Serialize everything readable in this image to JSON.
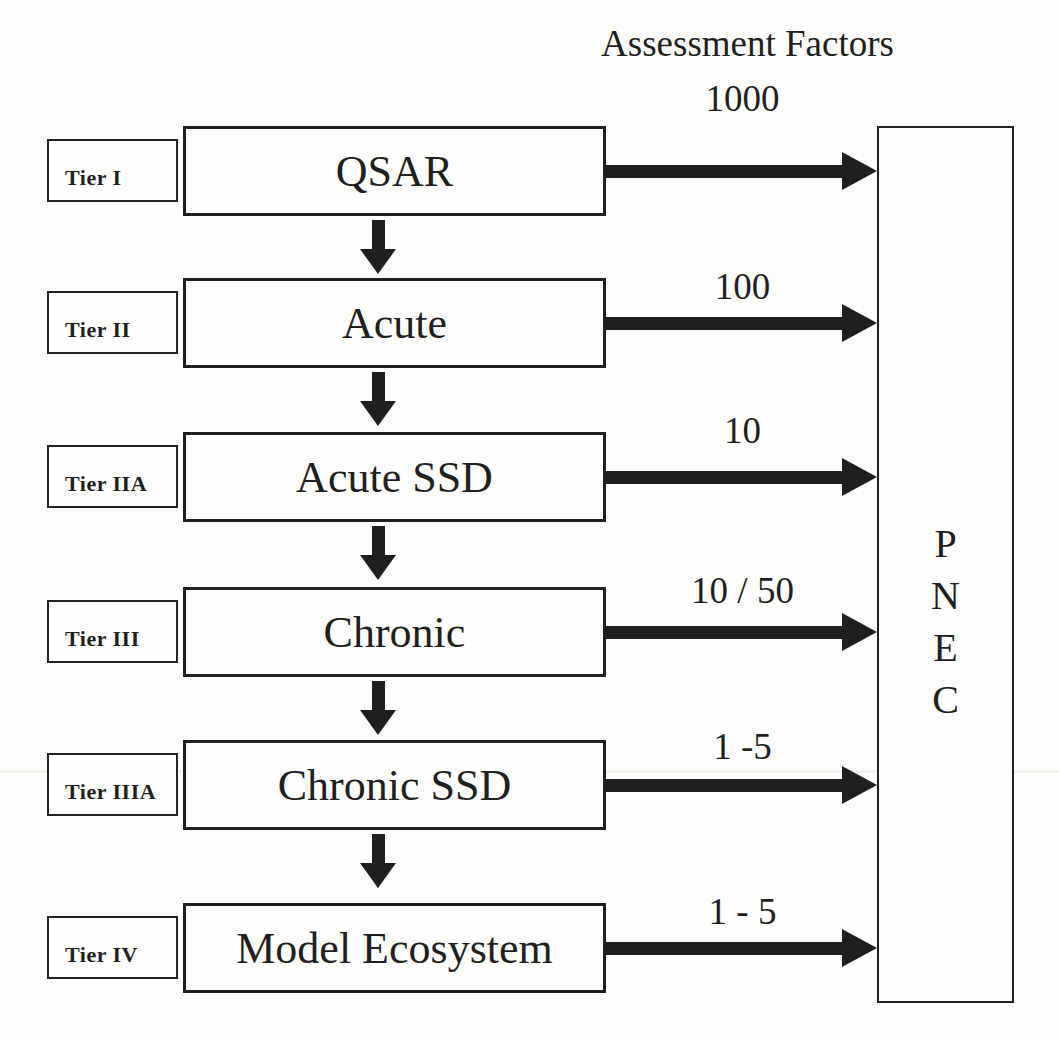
{
  "page": {
    "ink_color": "#1f1f1f",
    "background_color": "#fdfdfc"
  },
  "heading": {
    "title": "Assessment Factors"
  },
  "rows": [
    {
      "tier": "Tier I",
      "method": "QSAR",
      "factor": "1000"
    },
    {
      "tier": "Tier II",
      "method": "Acute",
      "factor": "100"
    },
    {
      "tier": "Tier IIA",
      "method": "Acute SSD",
      "factor": "10"
    },
    {
      "tier": "Tier III",
      "method": "Chronic",
      "factor": "10 / 50"
    },
    {
      "tier": "Tier IIIA",
      "method": "Chronic SSD",
      "factor": "1 -5"
    },
    {
      "tier": "Tier IV",
      "method": "Model Ecosystem",
      "factor": "1 - 5"
    }
  ],
  "pnec": {
    "letters": [
      "P",
      "N",
      "E",
      "C"
    ]
  }
}
